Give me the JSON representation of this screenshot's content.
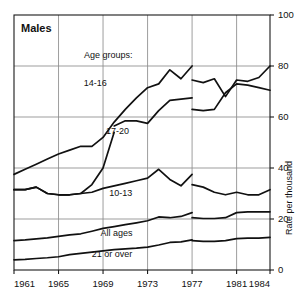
{
  "chart_data": {
    "type": "line",
    "title": "Males",
    "xlabel": "",
    "ylabel": "Rate per thousand",
    "legend_heading": "Age groups:",
    "legend_position": "inline-labels",
    "grid": true,
    "xlim": [
      1961,
      1984
    ],
    "ylim": [
      0,
      100
    ],
    "yticks": [
      0,
      20,
      40,
      60,
      80,
      100
    ],
    "ytick_labels": [
      "0",
      "20",
      "40",
      "60",
      "80",
      "100"
    ],
    "xticks": [
      1961,
      1965,
      1969,
      1973,
      1977,
      1981,
      1984
    ],
    "xtick_labels": [
      "1961",
      "1965",
      "1969",
      "1973",
      "1977",
      "1981",
      "1984"
    ],
    "series_break_year": 1977,
    "note": "Series are discontinuous at 1977 (definition change); each series is drawn as two segments.",
    "series": [
      {
        "name": "14-16",
        "label": "14-16",
        "label_x": 1968.3,
        "label_y": 72.0,
        "x": [
          1961,
          1962,
          1963,
          1964,
          1965,
          1966,
          1967,
          1968,
          1969,
          1970,
          1971,
          1972,
          1973,
          1974,
          1975,
          1976,
          1977
        ],
        "values": [
          37.5,
          39.5,
          41.5,
          43.5,
          45.5,
          47.0,
          48.5,
          48.5,
          52.0,
          58.0,
          63.0,
          67.5,
          71.5,
          73.0,
          78.5,
          75.0,
          80.0
        ],
        "x2": [
          1977,
          1978,
          1979,
          1980,
          1981,
          1982,
          1983,
          1984
        ],
        "values2": [
          74.5,
          73.5,
          75.0,
          68.0,
          74.5,
          74.0,
          75.5,
          80.0
        ]
      },
      {
        "name": "17-20",
        "label": "17-20",
        "label_x": 1970.3,
        "label_y": 53.5,
        "x": [
          1961,
          1962,
          1963,
          1964,
          1965,
          1966,
          1967,
          1968,
          1969,
          1970
        ],
        "values": [
          31.5,
          31.5,
          32.5,
          30.0,
          29.5,
          29.5,
          30.0,
          33.5,
          40.0,
          54.0
        ],
        "x2": [
          1970,
          1971,
          1972,
          1973,
          1974,
          1975,
          1976,
          1977
        ],
        "values2": [
          56.5,
          58.5,
          58.5,
          57.5,
          62.5,
          66.5,
          67.0,
          67.5
        ],
        "x3": [
          1977,
          1978,
          1979,
          1980,
          1981,
          1982,
          1983,
          1984
        ],
        "values3": [
          63.0,
          62.5,
          63.0,
          69.5,
          73.0,
          72.5,
          71.5,
          70.5
        ]
      },
      {
        "name": "10-13",
        "label": "10-13",
        "label_x": 1970.6,
        "label_y": 29.0,
        "x": [
          1961,
          1962,
          1963,
          1964,
          1965,
          1966,
          1967,
          1968,
          1969,
          1970,
          1971,
          1972,
          1973,
          1974,
          1975,
          1976,
          1977
        ],
        "values": [
          31.5,
          31.5,
          32.5,
          30.0,
          29.5,
          29.5,
          30.0,
          30.5,
          32.0,
          33.0,
          34.0,
          35.0,
          36.0,
          39.5,
          35.5,
          33.0,
          37.5
        ],
        "x2": [
          1977,
          1978,
          1979,
          1980,
          1981,
          1982,
          1983,
          1984
        ],
        "values2": [
          33.5,
          32.5,
          30.5,
          29.5,
          30.5,
          29.5,
          29.5,
          31.5
        ]
      },
      {
        "name": "All ages",
        "label": "All ages",
        "label_x": 1970.2,
        "label_y": 13.5,
        "x": [
          1961,
          1962,
          1963,
          1964,
          1965,
          1966,
          1967,
          1968,
          1969,
          1970,
          1971,
          1972,
          1973,
          1974,
          1975,
          1976,
          1977
        ],
        "values": [
          11.5,
          11.8,
          12.2,
          12.6,
          13.2,
          13.8,
          14.2,
          15.2,
          16.3,
          17.0,
          17.8,
          18.5,
          19.3,
          20.8,
          20.5,
          21.0,
          22.5
        ],
        "x2": [
          1977,
          1978,
          1979,
          1980,
          1981,
          1982,
          1983,
          1984
        ],
        "values2": [
          20.5,
          20.2,
          20.2,
          20.5,
          22.5,
          22.8,
          22.8,
          22.8
        ]
      },
      {
        "name": "21 or over",
        "label": "21 or over",
        "label_x": 1969.8,
        "label_y": 5.2,
        "x": [
          1961,
          1962,
          1963,
          1964,
          1965,
          1966,
          1967,
          1968,
          1969,
          1970,
          1971,
          1972,
          1973,
          1974,
          1975,
          1976,
          1977
        ],
        "values": [
          4.0,
          4.2,
          4.5,
          4.8,
          5.2,
          6.0,
          6.5,
          7.0,
          7.5,
          8.0,
          8.3,
          8.6,
          9.0,
          9.8,
          10.8,
          11.0,
          11.8
        ],
        "x2": [
          1977,
          1978,
          1979,
          1980,
          1981,
          1982,
          1983,
          1984
        ],
        "values2": [
          11.5,
          11.2,
          11.2,
          11.5,
          12.3,
          12.5,
          12.5,
          12.8
        ]
      }
    ]
  },
  "layout": {
    "plot_left": 14,
    "plot_right": 270,
    "plot_top": 15,
    "plot_bottom": 270
  }
}
